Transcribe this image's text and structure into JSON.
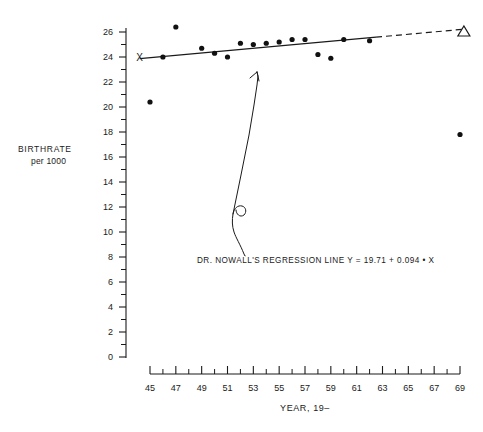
{
  "chart_data": {
    "type": "scatter",
    "title": "",
    "xlabel": "YEAR, 19–",
    "ylabel_line1": "BIRTHRATE",
    "ylabel_line2": "per 1000",
    "xlim": [
      45,
      69
    ],
    "ylim": [
      0,
      27
    ],
    "grid": false,
    "legend": "none",
    "x_tick_labels": [
      "45",
      "47",
      "49",
      "51",
      "53",
      "55",
      "57",
      "59",
      "61",
      "63",
      "65",
      "67",
      "69"
    ],
    "x_major_ticks": [
      45,
      47,
      49,
      51,
      53,
      55,
      57,
      59,
      61,
      63,
      65,
      67,
      69
    ],
    "x_minor_ticks": [
      46,
      48,
      50,
      52,
      54,
      56,
      58,
      60,
      62,
      64,
      66,
      68
    ],
    "y_tick_labels": [
      "0",
      "2",
      "4",
      "6",
      "8",
      "10",
      "12",
      "14",
      "16",
      "18",
      "20",
      "22",
      "24",
      "26"
    ],
    "y_major_ticks": [
      0,
      2,
      4,
      6,
      8,
      10,
      12,
      14,
      16,
      18,
      20,
      22,
      24,
      26
    ],
    "y_minor_ticks": [
      1,
      3,
      5,
      7,
      9,
      11,
      13,
      15,
      17,
      19,
      21,
      23,
      25
    ],
    "series": [
      {
        "name": "Observed birthrate",
        "marker": "filled-circle",
        "x": [
          45,
          46,
          47,
          49,
          50,
          51,
          52,
          53,
          54,
          55,
          56,
          57,
          58,
          59,
          60,
          62,
          69
        ],
        "y": [
          20.4,
          24.0,
          26.4,
          24.7,
          24.3,
          24.0,
          25.1,
          25.0,
          25.1,
          25.2,
          25.4,
          25.4,
          24.2,
          23.9,
          25.4,
          25.3,
          17.8
        ]
      }
    ],
    "annotations": [
      {
        "name": "regression-equation-label",
        "text": "DR. NOWALL'S  REGRESSION  LINE    Y = 19.71 + 0.094 • X"
      },
      {
        "name": "observed-start-marker",
        "marker": "x",
        "x": 44.2,
        "y": 24.0
      },
      {
        "name": "projected-endpoint-marker",
        "marker": "open-triangle",
        "x": 69.3,
        "y": 26.0
      }
    ],
    "regression": {
      "name": "DR. NOWALL'S REGRESSION LINE",
      "equation": "Y = 19.71 + 0.094 • X",
      "intercept": 19.71,
      "slope": 0.094,
      "solid_from_x": 44.2,
      "solid_to_x": 62.5,
      "dashed_from_x": 62.5,
      "dashed_to_x": 69.3
    }
  }
}
